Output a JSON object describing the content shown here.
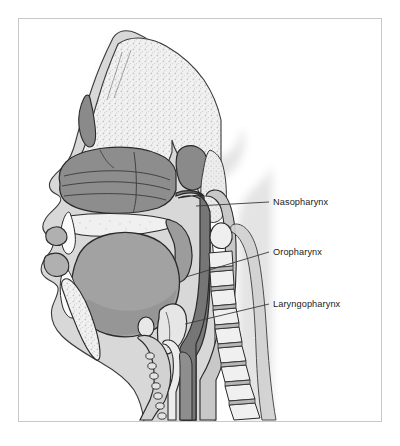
{
  "figure": {
    "frame_color": "#c9c9c9",
    "background_color": "#ffffff"
  },
  "labels": [
    {
      "id": "nasopharynx",
      "text": "Nasopharynx",
      "x": 273,
      "y": 205,
      "leader": {
        "x1": 269,
        "y1": 202,
        "x2": 196,
        "y2": 206
      }
    },
    {
      "id": "oropharynx",
      "text": "Oropharynx",
      "x": 273,
      "y": 255,
      "leader": {
        "x1": 269,
        "y1": 252,
        "x2": 186,
        "y2": 277
      }
    },
    {
      "id": "laryngopharynx",
      "text": "Laryngopharynx",
      "x": 273,
      "y": 307,
      "leader": {
        "x1": 269,
        "y1": 304,
        "x2": 185,
        "y2": 324
      }
    }
  ],
  "palette": {
    "shadow": "#e4e4e4",
    "skin": "#d6d6d6",
    "skin_light": "#dedede",
    "bone_light": "#f1f1f1",
    "bone_stipple": "#e6e6e6",
    "mucosa_dark": "#8c8c8c",
    "mucosa_mid": "#9a9a9a",
    "airway_dark": "#7c7c7c",
    "tongue": "#a0a0a0",
    "tongue_shade": "#8e8e8e",
    "sinus_dark": "#888888",
    "cartilage": "#cfcfcf",
    "vertebra": "#f0f0f0",
    "disc": "#b5b5b5",
    "outline": "#2a2a2a",
    "outline_soft": "#555555",
    "leader_line": "#3a3a3a",
    "text": "#1a1a1a"
  },
  "structures": [
    {
      "name": "frontal-sinus",
      "region": "upper-forehead"
    },
    {
      "name": "nasal-conchae",
      "region": "nasal-cavity"
    },
    {
      "name": "sphenoid-sinus",
      "region": "skull-base"
    },
    {
      "name": "hard-palate",
      "region": "oral-roof"
    },
    {
      "name": "soft-palate",
      "region": "oral-roof-posterior"
    },
    {
      "name": "tongue",
      "region": "oral-cavity"
    },
    {
      "name": "upper-teeth",
      "region": "maxilla"
    },
    {
      "name": "lower-teeth",
      "region": "mandible"
    },
    {
      "name": "mandible",
      "region": "lower-jaw"
    },
    {
      "name": "epiglottis",
      "region": "larynx"
    },
    {
      "name": "hyoid-bone",
      "region": "neck-anterior"
    },
    {
      "name": "thyroid-cartilage",
      "region": "larynx"
    },
    {
      "name": "trachea",
      "region": "neck-anterior"
    },
    {
      "name": "esophagus",
      "region": "neck-posterior"
    },
    {
      "name": "cervical-vertebrae",
      "region": "neck-posterior"
    }
  ]
}
